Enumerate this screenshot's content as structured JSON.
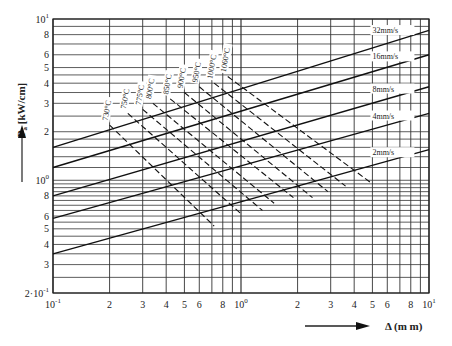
{
  "chart_data": {
    "type": "line",
    "title": "",
    "xlabel": "Δ (mm)",
    "ylabel": "Pₐ [kW/cm]",
    "xscale": "log",
    "yscale": "log",
    "xlim": [
      0.1,
      10
    ],
    "ylim": [
      0.2,
      10
    ],
    "grid": true,
    "x_ticks": [
      {
        "v": 0.1,
        "label": "10",
        "sup": "-1"
      },
      {
        "v": 0.2,
        "label": "2"
      },
      {
        "v": 0.3,
        "label": "3"
      },
      {
        "v": 0.4,
        "label": "4"
      },
      {
        "v": 0.5,
        "label": "5"
      },
      {
        "v": 0.6,
        "label": "6"
      },
      {
        "v": 0.8,
        "label": "8"
      },
      {
        "v": 1,
        "label": "10",
        "sup": "0"
      },
      {
        "v": 2,
        "label": "2"
      },
      {
        "v": 3,
        "label": "3"
      },
      {
        "v": 4,
        "label": "4"
      },
      {
        "v": 5,
        "label": "5"
      },
      {
        "v": 6,
        "label": "6"
      },
      {
        "v": 8,
        "label": "8"
      },
      {
        "v": 10,
        "label": "10",
        "sup": "1"
      }
    ],
    "y_ticks": [
      {
        "v": 0.2,
        "label": "2·10",
        "sup": "-1"
      },
      {
        "v": 0.3,
        "label": "3"
      },
      {
        "v": 0.4,
        "label": "4"
      },
      {
        "v": 0.5,
        "label": "5"
      },
      {
        "v": 0.6,
        "label": "6"
      },
      {
        "v": 0.8,
        "label": "8"
      },
      {
        "v": 1,
        "label": "10",
        "sup": "0"
      },
      {
        "v": 2,
        "label": "2"
      },
      {
        "v": 3,
        "label": "3"
      },
      {
        "v": 4,
        "label": "4"
      },
      {
        "v": 5,
        "label": "5"
      },
      {
        "v": 6,
        "label": "6"
      },
      {
        "v": 8,
        "label": "8"
      },
      {
        "v": 10,
        "label": "10",
        "sup": "1"
      }
    ],
    "series": [
      {
        "name": "32mm/s",
        "style": "solid",
        "x": [
          0.1,
          10
        ],
        "y": [
          1.6,
          8.5
        ],
        "label_at": [
          5.0,
          8.3
        ]
      },
      {
        "name": "16mm/s",
        "style": "solid",
        "x": [
          0.1,
          10
        ],
        "y": [
          1.2,
          6.0
        ],
        "label_at": [
          5.0,
          5.7
        ]
      },
      {
        "name": "8mm/s",
        "style": "solid",
        "x": [
          0.1,
          10
        ],
        "y": [
          0.8,
          3.8
        ],
        "label_at": [
          5.0,
          3.6
        ]
      },
      {
        "name": "4mm/s",
        "style": "solid",
        "x": [
          0.1,
          10
        ],
        "y": [
          0.58,
          2.6
        ],
        "label_at": [
          5.0,
          2.45
        ]
      },
      {
        "name": "2mm/s",
        "style": "solid",
        "x": [
          0.1,
          10
        ],
        "y": [
          0.35,
          1.55
        ],
        "label_at": [
          5.0,
          1.45
        ]
      },
      {
        "name": "730°C",
        "style": "dashed",
        "x": [
          0.2,
          0.72
        ],
        "y": [
          2.2,
          0.52
        ]
      },
      {
        "name": "750°C",
        "style": "dashed",
        "x": [
          0.25,
          1.0
        ],
        "y": [
          2.6,
          0.62
        ]
      },
      {
        "name": "775°C",
        "style": "dashed",
        "x": [
          0.3,
          1.3
        ],
        "y": [
          2.75,
          0.65
        ]
      },
      {
        "name": "800°C",
        "style": "dashed",
        "x": [
          0.34,
          1.5
        ],
        "y": [
          3.0,
          0.72
        ]
      },
      {
        "name": "850°C",
        "style": "dashed",
        "x": [
          0.42,
          1.9
        ],
        "y": [
          3.2,
          0.78
        ]
      },
      {
        "name": "900°C",
        "style": "dashed",
        "x": [
          0.5,
          2.4
        ],
        "y": [
          3.5,
          0.78
        ]
      },
      {
        "name": "950°C",
        "style": "dashed",
        "x": [
          0.6,
          2.9
        ],
        "y": [
          3.8,
          0.85
        ]
      },
      {
        "name": "1000°C",
        "style": "dashed",
        "x": [
          0.72,
          3.6
        ],
        "y": [
          4.0,
          0.92
        ]
      },
      {
        "name": "1060°C",
        "style": "dashed",
        "x": [
          0.85,
          5.0
        ],
        "y": [
          4.4,
          0.95
        ]
      }
    ],
    "legend": "inline labels",
    "annotations": [
      "arrow up beside y-axis label",
      "arrow right beside x-axis label"
    ]
  },
  "labels": {
    "y_axis_main": "P",
    "y_axis_sub": "a",
    "y_axis_unit": " [kW/cm]",
    "x_axis": "Δ (m m)"
  }
}
